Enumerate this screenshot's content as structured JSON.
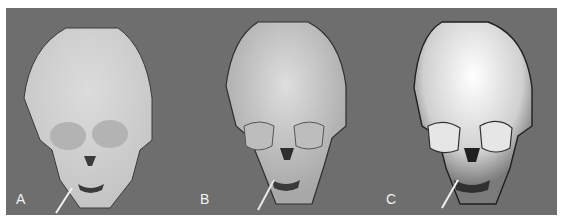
{
  "figure": {
    "background_color": "#6e6e6e",
    "panels": [
      {
        "label": "A",
        "rendering": "flat-shaded skull surface",
        "skull_color": "#d4d4d4",
        "outline_color": "#3a3a3a"
      },
      {
        "label": "B",
        "rendering": "smooth-shaded skull surface",
        "skull_color": "#cfcfcf",
        "outline_color": "#2e2e2e"
      },
      {
        "label": "C",
        "rendering": "high-detail shaded skull surface",
        "skull_color": "#e8e8e8",
        "outline_color": "#202020"
      }
    ]
  }
}
